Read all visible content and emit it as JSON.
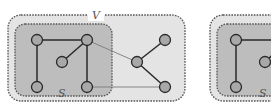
{
  "figures": [
    {
      "id": "left",
      "outer_label": "V",
      "inner_label": "S",
      "nodes": [
        {
          "id": "a",
          "in_s": true
        },
        {
          "id": "b",
          "in_s": true
        },
        {
          "id": "c",
          "in_s": true
        },
        {
          "id": "d",
          "in_s": true
        },
        {
          "id": "e",
          "in_s": true
        },
        {
          "id": "f",
          "in_s": false
        },
        {
          "id": "g",
          "in_s": false
        },
        {
          "id": "h",
          "in_s": false
        }
      ],
      "edges": [
        {
          "from": "a",
          "to": "b",
          "style": "strong"
        },
        {
          "from": "a",
          "to": "d",
          "style": "strong"
        },
        {
          "from": "b",
          "to": "c",
          "style": "strong"
        },
        {
          "from": "b",
          "to": "e",
          "style": "strong"
        },
        {
          "from": "b",
          "to": "f",
          "style": "cut"
        },
        {
          "from": "e",
          "to": "h",
          "style": "cut"
        },
        {
          "from": "f",
          "to": "g",
          "style": "strong"
        },
        {
          "from": "f",
          "to": "h",
          "style": "strong"
        }
      ]
    },
    {
      "id": "right",
      "inner_label": "S",
      "nodes": [
        {
          "id": "a",
          "in_s": true
        },
        {
          "id": "c",
          "in_s": true
        },
        {
          "id": "d",
          "in_s": true
        }
      ],
      "edges": [
        {
          "from": "a",
          "to": "d",
          "style": "strong"
        },
        {
          "from": "a",
          "to": "b",
          "style": "strong"
        }
      ]
    }
  ],
  "colors": {
    "outer_fill": "#e4e4e4",
    "inner_fill": "#bdbdbd",
    "node_fill": "#a8a8a8",
    "edge_strong": "#2a2a2a",
    "edge_cut": "#7a7a7a",
    "border": "#555555"
  }
}
